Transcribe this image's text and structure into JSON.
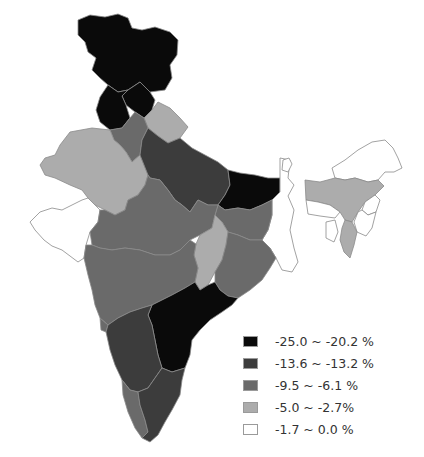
{
  "map": {
    "region": "India",
    "type": "choropleth",
    "regions": [
      {
        "name": "Jammu & Kashmir",
        "class": 0
      },
      {
        "name": "Himachal Pradesh",
        "class": 0
      },
      {
        "name": "Punjab",
        "class": 0
      },
      {
        "name": "Uttarakhand",
        "class": 3
      },
      {
        "name": "Haryana",
        "class": 2
      },
      {
        "name": "Rajasthan",
        "class": 3
      },
      {
        "name": "Uttar Pradesh",
        "class": 1
      },
      {
        "name": "Bihar",
        "class": 0
      },
      {
        "name": "Gujarat",
        "class": 4
      },
      {
        "name": "Madhya Pradesh",
        "class": 2
      },
      {
        "name": "Chhattisgarh",
        "class": 3
      },
      {
        "name": "Jharkhand",
        "class": 2
      },
      {
        "name": "West Bengal",
        "class": 4
      },
      {
        "name": "Odisha",
        "class": 2
      },
      {
        "name": "Maharashtra",
        "class": 2
      },
      {
        "name": "Andhra Pradesh / Telangana",
        "class": 0
      },
      {
        "name": "Karnataka",
        "class": 1
      },
      {
        "name": "Goa",
        "class": 2
      },
      {
        "name": "Kerala",
        "class": 2
      },
      {
        "name": "Tamil Nadu",
        "class": 1
      },
      {
        "name": "Assam",
        "class": 3
      },
      {
        "name": "Arunachal Pradesh",
        "class": 4
      },
      {
        "name": "Meghalaya",
        "class": 4
      },
      {
        "name": "Nagaland",
        "class": 4
      },
      {
        "name": "Manipur",
        "class": 4
      },
      {
        "name": "Mizoram",
        "class": 3
      },
      {
        "name": "Tripura",
        "class": 4
      },
      {
        "name": "Sikkim",
        "class": 4
      }
    ]
  },
  "legend": {
    "items": [
      {
        "label": "-25.0 ~ -20.2 %",
        "color": "#0a0a0a"
      },
      {
        "label": "-13.6 ~ -13.2 %",
        "color": "#3c3c3c"
      },
      {
        "label": "-9.5 ~ -6.1 %",
        "color": "#6a6a6a"
      },
      {
        "label": "-5.0 ~ -2.7%",
        "color": "#acacac"
      },
      {
        "label": "-1.7 ~ 0.0 %",
        "color": "#ffffff"
      }
    ]
  }
}
